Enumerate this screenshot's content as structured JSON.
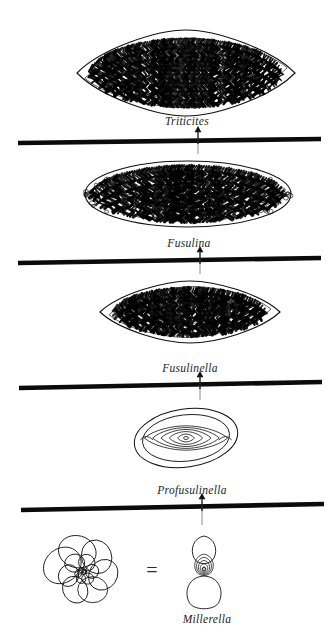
{
  "figure": {
    "background_color": "#ffffff",
    "line_color": "#111111",
    "fill_color": "#000000",
    "taxa": [
      {
        "id": "triticites",
        "label": "Triticites",
        "shape": "fusiform-spindle",
        "shading": "dense-black-septal-folds",
        "center_x": 186,
        "center_y": 73,
        "width": 218,
        "height": 86
      },
      {
        "id": "fusulina",
        "label": "Fusulina",
        "shape": "elongate-ellipse",
        "shading": "heavy-black-septal-folds",
        "center_x": 188,
        "center_y": 194,
        "width": 206,
        "height": 66
      },
      {
        "id": "fusulinella",
        "label": "Fusulinella",
        "shape": "lenticular-fusiform",
        "shading": "moderate-black-fill",
        "center_x": 190,
        "center_y": 312,
        "width": 180,
        "height": 62
      },
      {
        "id": "profusulinella",
        "label": "Profusulinella",
        "shape": "small-rounded-ovate",
        "shading": "outline-only",
        "center_x": 186,
        "center_y": 438,
        "width": 104,
        "height": 58
      },
      {
        "id": "millerella",
        "label": "Millerella",
        "shape": "tiny-lobate-axial-section",
        "shading": "outline-only",
        "center_x": 204,
        "center_y": 570,
        "width": 42,
        "height": 72
      }
    ],
    "spiral_view": {
      "id": "millerella-spiral",
      "label": "",
      "shape": "coiled-spiral-chambers",
      "center_x": 83,
      "center_y": 573,
      "width": 96,
      "height": 80
    },
    "equals_sign": {
      "glyph": "=",
      "x": 152,
      "y": 570
    },
    "boundary_lines": [
      {
        "id": "boundary-1",
        "x1": 18,
        "y1": 143,
        "x2": 321,
        "y2": 139
      },
      {
        "id": "boundary-2",
        "x1": 18,
        "y1": 263,
        "x2": 321,
        "y2": 258
      },
      {
        "id": "boundary-3",
        "x1": 19,
        "y1": 388,
        "x2": 322,
        "y2": 382
      },
      {
        "id": "boundary-4",
        "x1": 21,
        "y1": 510,
        "x2": 324,
        "y2": 504
      }
    ],
    "arrows": [
      {
        "id": "arrow-to-triticites",
        "x": 198,
        "y_from": 144,
        "y_to": 126
      },
      {
        "id": "arrow-to-fusulina",
        "x": 200,
        "y_from": 264,
        "y_to": 246
      },
      {
        "id": "arrow-to-fusulinella",
        "x": 200,
        "y_from": 389,
        "y_to": 371
      },
      {
        "id": "arrow-to-profusulinella",
        "x": 202,
        "y_from": 511,
        "y_to": 493
      }
    ],
    "connectors": [
      {
        "id": "connector-triticites",
        "x": 198,
        "y_from": 138,
        "y_to": 154
      },
      {
        "id": "connector-fusulina",
        "x": 200,
        "y_from": 258,
        "y_to": 274
      },
      {
        "id": "connector-fusulinella",
        "x": 200,
        "y_from": 383,
        "y_to": 400
      },
      {
        "id": "connector-profusulinella",
        "x": 202,
        "y_from": 505,
        "y_to": 525
      }
    ],
    "labels": [
      {
        "id": "label-triticites",
        "text": "Triticites",
        "x": 187,
        "y": 115
      },
      {
        "id": "label-fusulina",
        "text": "Fusulina",
        "x": 189,
        "y": 237
      },
      {
        "id": "label-fusulinella",
        "text": "Fusulinella",
        "x": 190,
        "y": 362
      },
      {
        "id": "label-profusulinella",
        "text": "Profusulinella",
        "x": 192,
        "y": 484
      },
      {
        "id": "label-millerella",
        "text": "Millerella",
        "x": 207,
        "y": 613
      }
    ]
  }
}
